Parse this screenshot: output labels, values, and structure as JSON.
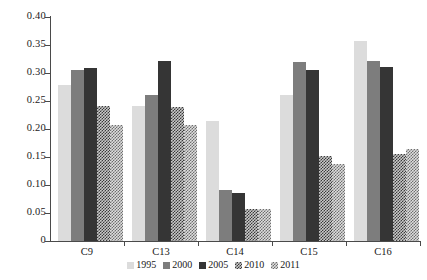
{
  "chart_data": {
    "type": "bar",
    "title": "",
    "subtitle": "",
    "xlabel": "",
    "ylabel": "",
    "categories": [
      "C9",
      "C13",
      "C14",
      "C15",
      "C16"
    ],
    "series": [
      {
        "name": "1995",
        "color": "#dcdcdc",
        "pattern": "solid-light",
        "values": [
          0.278,
          0.241,
          0.215,
          0.261,
          0.358
        ]
      },
      {
        "name": "2000",
        "color": "#7d7d7d",
        "pattern": "solid-mid",
        "values": [
          0.305,
          0.261,
          0.091,
          0.32,
          0.322
        ]
      },
      {
        "name": "2005",
        "color": "#353535",
        "pattern": "solid-dark",
        "values": [
          0.309,
          0.322,
          0.085,
          0.305,
          0.311
        ]
      },
      {
        "name": "2010",
        "color": "#949494",
        "pattern": "checker-dark",
        "values": [
          0.241,
          0.239,
          0.058,
          0.152,
          0.155
        ]
      },
      {
        "name": "2011",
        "color": "#b5b5b5",
        "pattern": "checker-light",
        "values": [
          0.207,
          0.207,
          0.057,
          0.137,
          0.164
        ]
      }
    ],
    "ylim": [
      0,
      0.4
    ],
    "ytick_values": [
      0,
      0.05,
      0.1,
      0.15,
      0.2,
      0.25,
      0.3,
      0.35,
      0.4
    ],
    "ytick_labels": [
      "0",
      "0.05",
      "0.10",
      "0.15",
      "0.20",
      "0.25",
      "0.30",
      "0.35",
      "0.40"
    ],
    "grid": false,
    "legend_position": "bottom-center",
    "legend_entries": [
      "1995",
      "2000",
      "2005",
      "2010",
      "2011"
    ],
    "annotations": []
  }
}
